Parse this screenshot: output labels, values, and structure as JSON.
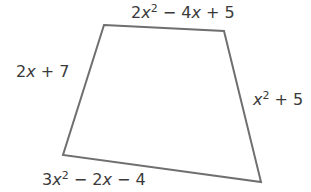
{
  "diagram": {
    "shape": "quadrilateral",
    "stroke_color": "#6f6f6f",
    "text_color": "#3a3a3a",
    "vertices": [
      [
        104,
        25
      ],
      [
        224,
        31
      ],
      [
        261,
        182
      ],
      [
        63,
        155
      ]
    ],
    "sides": {
      "top": {
        "coef": "2",
        "var": "x",
        "exp": "2",
        "rest": " − 4",
        "var2": "x",
        "tail": " + 5",
        "full": "2x^2 − 4x + 5"
      },
      "left": {
        "coef": "2",
        "var": "x",
        "tail": " + 7",
        "full": "2x + 7"
      },
      "right": {
        "var": "x",
        "exp": "2",
        "tail": " + 5",
        "full": "x^2 + 5"
      },
      "bottom": {
        "coef": "3",
        "var": "x",
        "exp": "2",
        "rest": " − 2",
        "var2": "x",
        "tail": " − 4",
        "full": "3x^2 − 2x − 4"
      }
    }
  }
}
